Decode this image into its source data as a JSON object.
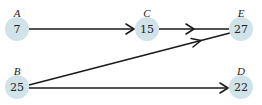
{
  "diagram": {
    "type": "directed-graph",
    "colors": {
      "node_fill": "#cfe3e8",
      "edge": "#1a1a1a",
      "text": "#222222"
    },
    "nodes": [
      {
        "id": "A",
        "label": "A",
        "value": "7",
        "x": 17,
        "y": 29
      },
      {
        "id": "C",
        "label": "C",
        "value": "15",
        "x": 147,
        "y": 29
      },
      {
        "id": "E",
        "label": "E",
        "value": "27",
        "x": 241,
        "y": 29
      },
      {
        "id": "B",
        "label": "B",
        "value": "25",
        "x": 17,
        "y": 87
      },
      {
        "id": "D",
        "label": "D",
        "value": "22",
        "x": 241,
        "y": 87
      }
    ],
    "edges": [
      {
        "from": "A",
        "to": "C"
      },
      {
        "from": "C",
        "to": "E"
      },
      {
        "from": "B",
        "to": "E"
      },
      {
        "from": "B",
        "to": "D"
      }
    ]
  }
}
